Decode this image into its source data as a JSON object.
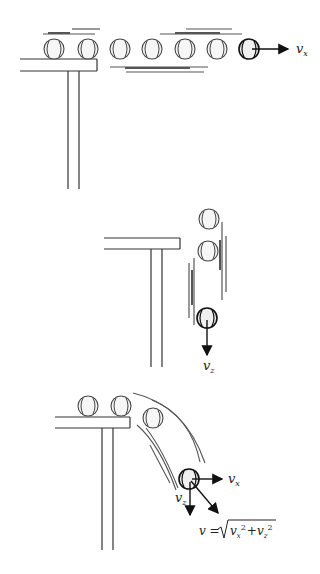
{
  "diagram": {
    "panels": [
      {
        "id": "horizontal",
        "description": "Ball rolling horizontally along and past the table edge",
        "ball_count": 7,
        "velocity_label": "v",
        "velocity_subscript": "x"
      },
      {
        "id": "vertical",
        "description": "Ball falling vertically beside table",
        "ball_count": 3,
        "velocity_label": "v",
        "velocity_subscript": "z"
      },
      {
        "id": "combined",
        "description": "Ball leaving table on curved path with horizontal and vertical components",
        "ball_count": 4,
        "vx_label": "v",
        "vx_subscript": "x",
        "vz_label": "v",
        "vz_subscript": "z",
        "resultant_formula": {
          "lhs": "v =",
          "radicand_1": "v",
          "radicand_1_sub": "x",
          "radicand_1_sup": "2",
          "plus": "+",
          "radicand_2": "v",
          "radicand_2_sub": "z",
          "radicand_2_sup": "2"
        }
      }
    ],
    "colors": {
      "line": "#222222",
      "motion_lines": "#444444",
      "ball_fill": "#f4f4f4"
    }
  }
}
